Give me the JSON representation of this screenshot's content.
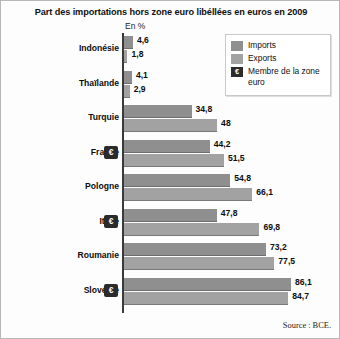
{
  "chart_data": {
    "type": "bar",
    "title": "Part des importations hors zone euro libéllées en euros en 2009",
    "unit_label": "En %",
    "xlabel": "",
    "ylabel": "",
    "orientation": "horizontal",
    "grid": false,
    "xlim": [
      0,
      90
    ],
    "legend_position": "top-right",
    "categories": [
      "Indonésie",
      "Thaïlande",
      "Turquie",
      "France",
      "Pologne",
      "Italie",
      "Roumanie",
      "Slovénie"
    ],
    "euro_member": [
      false,
      false,
      false,
      true,
      false,
      true,
      false,
      true
    ],
    "series": [
      {
        "name": "Imports",
        "color": "#8f8f8f",
        "values": [
          4.6,
          4.1,
          34.8,
          44.2,
          54.8,
          47.8,
          73.2,
          86.1
        ]
      },
      {
        "name": "Exports",
        "color": "#a2a2a2",
        "values": [
          1.8,
          2.9,
          48,
          51.5,
          66.1,
          69.8,
          77.5,
          84.7
        ]
      }
    ],
    "value_labels": {
      "imports": [
        "4,6",
        "4,1",
        "34,8",
        "44,2",
        "54,8",
        "47,8",
        "73,2",
        "86,1"
      ],
      "exports": [
        "1,8",
        "2,9",
        "48",
        "51,5",
        "66,1",
        "69,8",
        "77,5",
        "84,7"
      ]
    }
  },
  "legend": {
    "items": [
      {
        "label": "Imports",
        "type": "swatch"
      },
      {
        "label": "Exports",
        "type": "swatch"
      },
      {
        "label": "Membre de la zone euro",
        "type": "euro",
        "glyph": "€"
      }
    ]
  },
  "euro_glyph": "€",
  "source": "Source : BCE."
}
